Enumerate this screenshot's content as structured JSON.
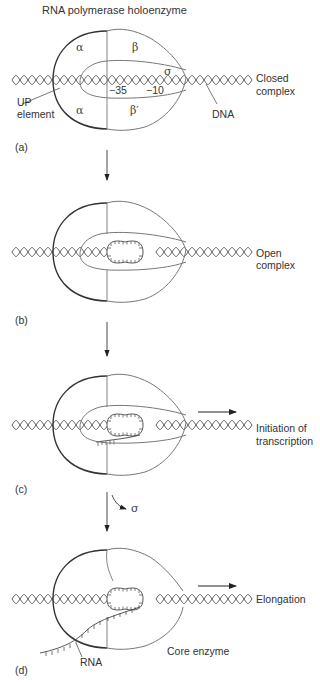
{
  "title": "RNA polymerase holoenzyme",
  "colors": {
    "outline_dark": "#333333",
    "outline_light": "#777777",
    "dna": "#555555",
    "text": "#333333"
  },
  "panels": [
    {
      "id": "a",
      "label": "(a)",
      "state": "Closed\ncomplex",
      "state_line1": "Closed",
      "state_line2": "complex",
      "subunits": {
        "alpha_top": "α",
        "beta": "β",
        "sigma": "σ",
        "alpha_bottom": "α",
        "beta_prime": "β′"
      },
      "promoter": {
        "minus35": "−35",
        "minus10": "−10"
      },
      "callouts": {
        "up_line1": "UP",
        "up_line2": "element",
        "dna": "DNA"
      }
    },
    {
      "id": "b",
      "label": "(b)",
      "state_line1": "Open",
      "state_line2": "complex"
    },
    {
      "id": "c",
      "label": "(c)",
      "state_line1": "Initiation of",
      "state_line2": "transcription"
    },
    {
      "id": "d",
      "label": "(d)",
      "state_line1": "Elongation",
      "state_line2": "",
      "callouts": {
        "rna": "RNA",
        "core": "Core enzyme"
      }
    }
  ],
  "transitions": {
    "sigma_release": "σ"
  }
}
